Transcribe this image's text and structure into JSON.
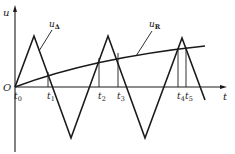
{
  "figure": {
    "axis_y_label": "u",
    "axis_x_label": "t",
    "origin_label": "O",
    "colors": {
      "ink": "#1a1a1a",
      "background": "#ffffff"
    },
    "signals": [
      {
        "name": "triangle-wave",
        "label_main": "u",
        "label_sub": "Δ",
        "label_pos": [
          49,
          27
        ],
        "leader": [
          [
            52,
            30
          ],
          [
            39,
            51
          ]
        ]
      },
      {
        "name": "ramp-curve",
        "label_main": "u",
        "label_sub": "R",
        "label_pos": [
          149,
          27
        ],
        "leader": [
          [
            152,
            31
          ],
          [
            136,
            56
          ]
        ]
      }
    ],
    "time_marks": [
      {
        "main": "t",
        "sub": "0",
        "x": 15
      },
      {
        "main": "t",
        "sub": "1",
        "x": 48
      },
      {
        "main": "t",
        "sub": "2",
        "x": 99
      },
      {
        "main": "t",
        "sub": "3",
        "x": 118
      },
      {
        "main": "t",
        "sub": "4",
        "x": 178
      },
      {
        "main": "t",
        "sub": "5",
        "x": 186
      }
    ],
    "triangle_points": [
      [
        15,
        87
      ],
      [
        34,
        36
      ],
      [
        71,
        138
      ],
      [
        108,
        36
      ],
      [
        145,
        138
      ],
      [
        182,
        38
      ],
      [
        205,
        100
      ]
    ],
    "ramp_curve_path": "M15,87 C60,70 120,55 205,46"
  }
}
